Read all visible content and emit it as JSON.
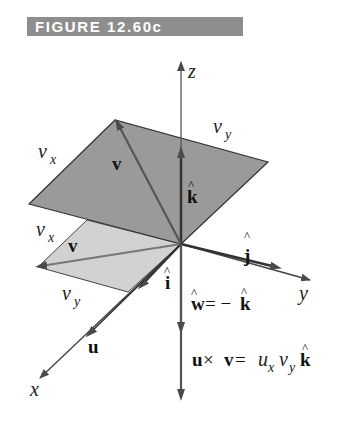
{
  "figure": {
    "title": "FIGURE 12.60c"
  },
  "axes": {
    "x_label": "x",
    "y_label": "y",
    "z_label": "z"
  },
  "labels": {
    "upper_vx": {
      "main": "v",
      "sub": "x"
    },
    "upper_vy": {
      "main": "v",
      "sub": "y"
    },
    "upper_v": "v",
    "k_hat": "k",
    "lower_vx": {
      "main": "v",
      "sub": "x"
    },
    "lower_v": "v",
    "lower_vy": {
      "main": "v",
      "sub": "y"
    },
    "j_hat": "j",
    "i_hat": "i",
    "u": "u",
    "w_eq": {
      "w": "w",
      "eq": " = −",
      "k": "k"
    },
    "cross_eq": {
      "u": "u",
      "times": " × ",
      "v": "v",
      "eq": " = ",
      "ux": "u",
      "ux_sub": "x",
      "vy": "v",
      "vy_sub": "y",
      "k": "k"
    }
  },
  "colors": {
    "upper_plane": "#9a9a9a",
    "lower_plane": "#d2d2d2",
    "axis": "#555555",
    "vector": "#555555",
    "banner": "#8e8e8e"
  }
}
